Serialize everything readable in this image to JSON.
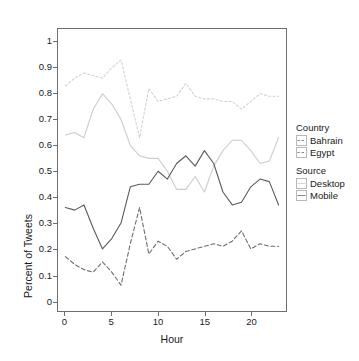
{
  "chart_data": {
    "type": "line",
    "title": "",
    "xlabel": "Hour",
    "ylabel": "Percent of Tweets",
    "xlim": [
      -0.8,
      23.8
    ],
    "ylim": [
      -0.04,
      1.05
    ],
    "grid": false,
    "legend_position": "right",
    "x": [
      0,
      1,
      2,
      3,
      4,
      5,
      6,
      7,
      8,
      9,
      10,
      11,
      12,
      13,
      14,
      15,
      16,
      17,
      18,
      19,
      20,
      21,
      22,
      23
    ],
    "xticks": [
      "0",
      "5",
      "10",
      "15",
      "20"
    ],
    "xtick_values": [
      0,
      5,
      10,
      15,
      20
    ],
    "yticks": [
      "0",
      "0.1",
      "0.2",
      "0.3",
      "0.4",
      "0.5",
      "0.6",
      "0.7",
      "0.8",
      "0.9",
      "1"
    ],
    "ytick_values": [
      0,
      0.1,
      0.2,
      0.3,
      0.4,
      0.5,
      0.6,
      0.7,
      0.8,
      0.9,
      1
    ],
    "series": [
      {
        "name": "Egypt Desktop",
        "country": "Egypt",
        "source": "Desktop",
        "style": "dotted",
        "color": "#d2d2d2",
        "values": [
          0.83,
          0.86,
          0.88,
          0.87,
          0.86,
          0.9,
          0.93,
          0.78,
          0.63,
          0.82,
          0.77,
          0.78,
          0.79,
          0.84,
          0.79,
          0.78,
          0.78,
          0.77,
          0.77,
          0.74,
          0.77,
          0.8,
          0.79,
          0.79
        ]
      },
      {
        "name": "Bahrain Desktop",
        "country": "Bahrain",
        "source": "Desktop",
        "style": "solid",
        "color": "#cccccc",
        "values": [
          0.64,
          0.65,
          0.63,
          0.74,
          0.8,
          0.76,
          0.7,
          0.6,
          0.56,
          0.55,
          0.55,
          0.5,
          0.43,
          0.43,
          0.48,
          0.42,
          0.52,
          0.58,
          0.62,
          0.62,
          0.58,
          0.53,
          0.54,
          0.63
        ]
      },
      {
        "name": "Bahrain Mobile",
        "country": "Bahrain",
        "source": "Mobile",
        "style": "solid",
        "color": "#5a5a5a",
        "values": [
          0.36,
          0.35,
          0.37,
          0.28,
          0.2,
          0.24,
          0.3,
          0.44,
          0.45,
          0.45,
          0.5,
          0.47,
          0.53,
          0.56,
          0.52,
          0.58,
          0.53,
          0.42,
          0.37,
          0.38,
          0.44,
          0.47,
          0.46,
          0.37
        ]
      },
      {
        "name": "Egypt Mobile",
        "country": "Egypt",
        "source": "Mobile",
        "style": "dashed",
        "color": "#6e6e6e",
        "values": [
          0.17,
          0.14,
          0.12,
          0.11,
          0.15,
          0.11,
          0.06,
          0.22,
          0.36,
          0.18,
          0.23,
          0.21,
          0.16,
          0.19,
          0.2,
          0.21,
          0.22,
          0.21,
          0.23,
          0.27,
          0.2,
          0.22,
          0.21,
          0.21
        ]
      }
    ]
  },
  "axis": {
    "x_title": "Hour",
    "y_title": "Percent of Tweets"
  },
  "legend": {
    "groups": [
      {
        "title": "Country",
        "items": [
          {
            "label": "Bahrain",
            "key_style": "dashed",
            "key_color": "#6e6e6e"
          },
          {
            "label": "Egypt",
            "key_style": "dashed",
            "key_color": "#6e6e6e"
          }
        ]
      },
      {
        "title": "Source",
        "items": [
          {
            "label": "Desktop",
            "key_style": "solid",
            "key_color": "#cccccc"
          },
          {
            "label": "Mobile",
            "key_style": "solid",
            "key_color": "#6e6e6e"
          }
        ]
      }
    ]
  }
}
